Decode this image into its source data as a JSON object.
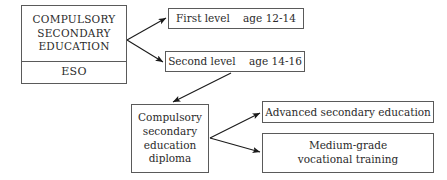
{
  "diagram": {
    "colors": {
      "background": "#ffffff",
      "box_border": "#5a5a5a",
      "text": "#2b2b2b",
      "arrow": "#1a1a1a"
    },
    "nodes": {
      "eso": {
        "upper_lines": [
          "COMPULSORY",
          "SECONDARY",
          "EDUCATION"
        ],
        "lower_label": "ESO"
      },
      "first_level": {
        "label": "First level    age 12-14",
        "stage": "First level",
        "age": "age 12-14"
      },
      "second_level": {
        "label": "Second level    age 14-16",
        "stage": "Second level",
        "age": "age 14-16"
      },
      "diploma": {
        "lines": [
          "Compulsory",
          "secondary",
          "education",
          "diploma"
        ]
      },
      "advanced": {
        "label": "Advanced secondary education"
      },
      "vocational": {
        "lines": [
          "Medium-grade",
          "vocational training"
        ]
      }
    },
    "edges": [
      {
        "name": "eso-to-first-level",
        "from": "eso",
        "to": "first_level"
      },
      {
        "name": "eso-to-second-level",
        "from": "eso",
        "to": "second_level"
      },
      {
        "name": "second-level-to-diploma",
        "from": "second_level",
        "to": "diploma"
      },
      {
        "name": "diploma-to-advanced",
        "from": "diploma",
        "to": "advanced"
      },
      {
        "name": "diploma-to-vocational",
        "from": "diploma",
        "to": "vocational"
      }
    ]
  }
}
